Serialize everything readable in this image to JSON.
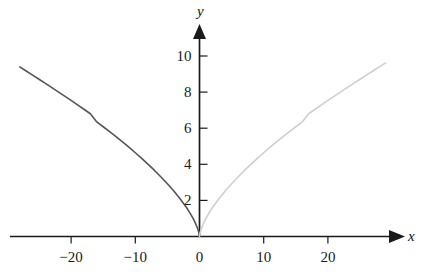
{
  "chart_data": {
    "type": "line",
    "title": "",
    "subtitle": "",
    "xlabel": "x",
    "ylabel": "y",
    "xlim": [
      -29,
      30
    ],
    "ylim": [
      0,
      11
    ],
    "grid": false,
    "legend": "none",
    "x_ticks": [
      -20,
      -10,
      0,
      10,
      20
    ],
    "x_tick_labels": [
      "−20",
      "−10",
      "0",
      "10",
      "20"
    ],
    "y_ticks": [
      2,
      4,
      6,
      8,
      10
    ],
    "y_tick_labels": [
      "2",
      "4",
      "6",
      "8",
      "10"
    ],
    "axes_style": {
      "x_axis_arrow": true,
      "y_axis_arrow": true,
      "x_tick_side": "below",
      "y_tick_side": "right",
      "axis_color": "#1a1a1a"
    },
    "series": [
      {
        "name": "left-branch",
        "color": "#555555",
        "linewidth": 1.6,
        "points": [
          [
            -28.0,
            9.4
          ],
          [
            -27.0,
            9.17
          ],
          [
            -26.0,
            8.94
          ],
          [
            -25.0,
            8.71
          ],
          [
            -24.0,
            8.48
          ],
          [
            -23.0,
            8.25
          ],
          [
            -22.0,
            8.01
          ],
          [
            -21.0,
            7.78
          ],
          [
            -20.0,
            7.54
          ],
          [
            -19.0,
            7.29
          ],
          [
            -18.0,
            7.05
          ],
          [
            -17.0,
            6.8
          ],
          [
            -16.0,
            6.35
          ],
          [
            -15.0,
            6.08
          ],
          [
            -14.0,
            5.81
          ],
          [
            -13.0,
            5.53
          ],
          [
            -12.0,
            5.24
          ],
          [
            -11.0,
            4.95
          ],
          [
            -10.0,
            4.64
          ],
          [
            -9.0,
            4.33
          ],
          [
            -8.0,
            4.0
          ],
          [
            -7.0,
            3.66
          ],
          [
            -6.0,
            3.3
          ],
          [
            -5.0,
            2.92
          ],
          [
            -4.0,
            2.52
          ],
          [
            -3.0,
            2.08
          ],
          [
            -2.0,
            1.59
          ],
          [
            -1.5,
            1.31
          ],
          [
            -1.0,
            1.0
          ],
          [
            -0.6,
            0.71
          ],
          [
            -0.3,
            0.45
          ],
          [
            -0.1,
            0.22
          ],
          [
            -0.03,
            0.1
          ],
          [
            0.0,
            0.0
          ]
        ]
      },
      {
        "name": "right-branch",
        "color": "#cfcfcf",
        "linewidth": 1.6,
        "points": [
          [
            0.0,
            0.0
          ],
          [
            0.03,
            0.1
          ],
          [
            0.1,
            0.22
          ],
          [
            0.3,
            0.45
          ],
          [
            0.6,
            0.71
          ],
          [
            1.0,
            1.0
          ],
          [
            1.5,
            1.31
          ],
          [
            2.0,
            1.59
          ],
          [
            3.0,
            2.08
          ],
          [
            4.0,
            2.52
          ],
          [
            5.0,
            2.92
          ],
          [
            6.0,
            3.3
          ],
          [
            7.0,
            3.66
          ],
          [
            8.0,
            4.0
          ],
          [
            9.0,
            4.33
          ],
          [
            10.0,
            4.64
          ],
          [
            11.0,
            4.95
          ],
          [
            12.0,
            5.24
          ],
          [
            13.0,
            5.53
          ],
          [
            14.0,
            5.81
          ],
          [
            15.0,
            6.08
          ],
          [
            16.0,
            6.35
          ],
          [
            17.0,
            6.8
          ],
          [
            18.0,
            7.05
          ],
          [
            19.0,
            7.29
          ],
          [
            20.0,
            7.54
          ],
          [
            21.0,
            7.78
          ],
          [
            22.0,
            8.01
          ],
          [
            23.0,
            8.25
          ],
          [
            24.0,
            8.48
          ],
          [
            25.0,
            8.71
          ],
          [
            26.0,
            8.94
          ],
          [
            27.0,
            9.17
          ],
          [
            28.0,
            9.4
          ],
          [
            29.0,
            9.62
          ]
        ]
      }
    ],
    "annotations": []
  },
  "axis_labels": {
    "x": "x",
    "y": "y"
  },
  "tick_text": {
    "x": [
      "−20",
      "−10",
      "0",
      "10",
      "20"
    ],
    "y": [
      "10",
      "8",
      "6",
      "4",
      "2"
    ]
  }
}
